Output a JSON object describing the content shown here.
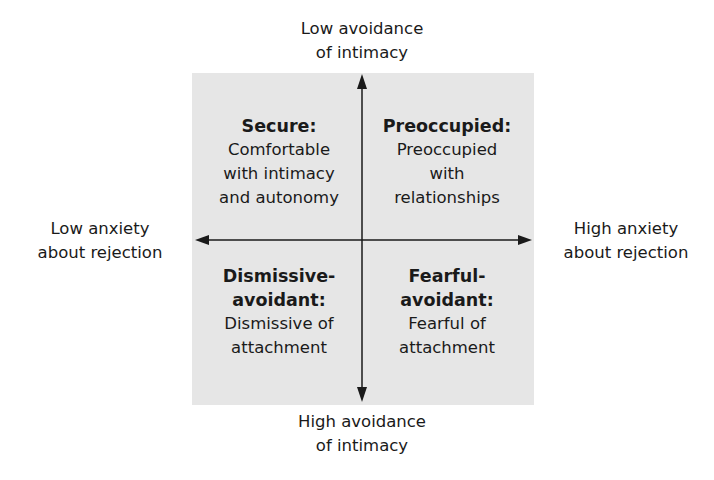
{
  "axes": {
    "top": {
      "line1": "Low avoidance",
      "line2": "of intimacy"
    },
    "bottom": {
      "line1": "High avoidance",
      "line2": "of intimacy"
    },
    "left": {
      "line1": "Low anxiety",
      "line2": "about rejection"
    },
    "right": {
      "line1": "High anxiety",
      "line2": "about rejection"
    }
  },
  "quadrants": {
    "top_left": {
      "title": "Secure:",
      "desc": [
        "Comfortable",
        "with intimacy",
        "and autonomy"
      ]
    },
    "top_right": {
      "title": "Preoccupied:",
      "desc": [
        "Preoccupied",
        "with",
        "relationships"
      ]
    },
    "bottom_left": {
      "title": [
        "Dismissive-",
        "avoidant:"
      ],
      "desc": [
        "Dismissive of",
        "attachment"
      ]
    },
    "bottom_right": {
      "title": [
        "Fearful-",
        "avoidant:"
      ],
      "desc": [
        "Fearful of",
        "attachment"
      ]
    }
  },
  "colors": {
    "box_fill": "#e6e6e6",
    "axis": "#1a1a1a"
  }
}
